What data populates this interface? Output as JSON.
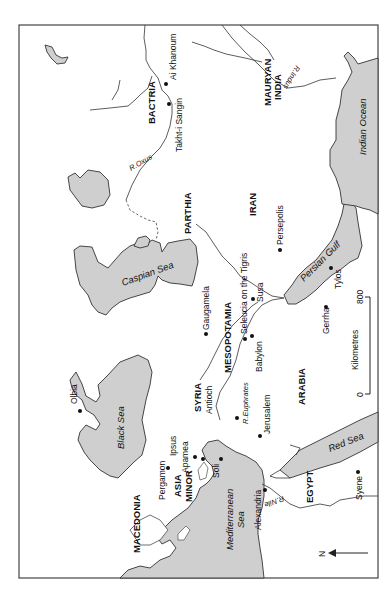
{
  "map": {
    "orientation_note": "rotated 90 degrees, north arrow points left",
    "regions": {
      "bactria": "BACTRIA",
      "mauryan_india_1": "MAURYAN",
      "mauryan_india_2": "INDIA",
      "parthia": "PARTHIA",
      "iran": "IRAN",
      "mesopotamia": "MESOPOTAMIA",
      "syria": "SYRIA",
      "arabia": "ARABIA",
      "asia_minor_1": "ASIA",
      "asia_minor_2": "MINOR",
      "macedonia": "MACEDONIA",
      "egypt": "EGYPT"
    },
    "seas": {
      "caspian": "Caspian Sea",
      "black": "Black Sea",
      "mediterranean_1": "Mediterranean",
      "mediterranean_2": "Sea",
      "red": "Red Sea",
      "persian_gulf": "Persian Gulf",
      "indian_ocean": "Indian Ocean"
    },
    "rivers": {
      "oxus": "R.Oxus",
      "indus": "R.Indus",
      "euphrates": "R.Euphrates",
      "nile": "R.Nile"
    },
    "cities": {
      "ai_khanoum": "Ai Khanoum",
      "takht_i_sangin": "Takht-i Sangin",
      "persepolis": "Persepolis",
      "seleucia": "Seleucia on the Tigris",
      "susa": "Susa",
      "gaugamela": "Gaugamela",
      "babylon": "Babylon",
      "tylos": "Tylos",
      "gerrha": "Gerrha",
      "antioch": "Antioch",
      "jerusalem": "Jerusalem",
      "ipsus": "Ipsus",
      "apamea": "Apamea",
      "pergamon": "Pergamon",
      "olbia": "Olbia",
      "soli": "Soli",
      "alexandria": "Alexandria",
      "syene": "Syene"
    },
    "scale_bar": {
      "unit": "Kilometres",
      "min": "0",
      "max": "800"
    },
    "north_arrow": {
      "label": "N"
    },
    "colors": {
      "water": "#cfcfcf",
      "line": "#333333",
      "background": "#ffffff"
    }
  }
}
